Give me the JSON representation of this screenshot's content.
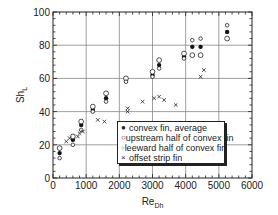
{
  "chart_data": {
    "type": "scatter",
    "title": "",
    "xlabel": "Re_Dh",
    "xlabel_main": "Re",
    "xlabel_sub": "Dh",
    "ylabel": "Sh_L",
    "ylabel_main": "Sh",
    "ylabel_sub": "L",
    "xlim": [
      0,
      6000
    ],
    "ylim": [
      0,
      100
    ],
    "xticks": [
      0,
      1000,
      2000,
      3000,
      4000,
      5000,
      6000
    ],
    "yticks": [
      0,
      20,
      40,
      60,
      80,
      100
    ],
    "grid": true,
    "legend_position": "lower right (inside)",
    "series": [
      {
        "name": "convex fin, average",
        "marker": "filled-circle",
        "points": [
          [
            200,
            15
          ],
          [
            600,
            23
          ],
          [
            850,
            32
          ],
          [
            1200,
            41
          ],
          [
            1600,
            48
          ],
          [
            2200,
            59
          ],
          [
            3000,
            62
          ],
          [
            3200,
            68
          ],
          [
            3950,
            73
          ],
          [
            4200,
            79
          ],
          [
            4450,
            79
          ],
          [
            5250,
            88
          ]
        ]
      },
      {
        "name": "upstream half of convex fin",
        "marker": "open-circle",
        "points": [
          [
            200,
            18
          ],
          [
            600,
            25
          ],
          [
            850,
            34
          ],
          [
            1200,
            43
          ],
          [
            1600,
            51
          ],
          [
            2200,
            60
          ],
          [
            3000,
            64
          ],
          [
            3200,
            71
          ],
          [
            3950,
            75
          ],
          [
            4200,
            74
          ],
          [
            4450,
            74
          ],
          [
            5250,
            84
          ]
        ]
      },
      {
        "name": "leeward half of convex fin",
        "marker": "small-open-circle",
        "points": [
          [
            200,
            12
          ],
          [
            600,
            20
          ],
          [
            850,
            29
          ],
          [
            1200,
            40
          ],
          [
            1600,
            46
          ],
          [
            2200,
            58
          ],
          [
            3000,
            61
          ],
          [
            3200,
            66
          ],
          [
            3950,
            72
          ],
          [
            4200,
            83
          ],
          [
            4450,
            84
          ],
          [
            5250,
            92
          ]
        ]
      },
      {
        "name": "offset strip fin",
        "marker": "x",
        "points": [
          [
            400,
            22
          ],
          [
            500,
            24
          ],
          [
            750,
            25
          ],
          [
            800,
            27
          ],
          [
            900,
            28
          ],
          [
            1350,
            35
          ],
          [
            1550,
            34
          ],
          [
            2250,
            42
          ],
          [
            2250,
            40
          ],
          [
            2700,
            46
          ],
          [
            3050,
            48
          ],
          [
            3200,
            49
          ],
          [
            3350,
            47
          ],
          [
            3700,
            44
          ],
          [
            4450,
            61
          ],
          [
            4550,
            65
          ]
        ]
      }
    ]
  }
}
